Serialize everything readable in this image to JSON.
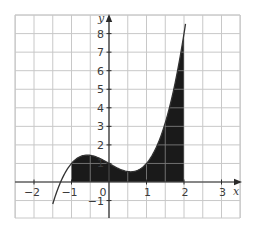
{
  "chart_data": {
    "type": "area",
    "title": "",
    "xlabel": "x",
    "ylabel": "y",
    "xlim": [
      -2.5,
      3.5
    ],
    "ylim": [
      -2,
      9
    ],
    "grid": true,
    "x_ticks": [
      -2,
      -1,
      0,
      1,
      2,
      3
    ],
    "x_tick_labels": [
      "−2",
      "−1",
      "0",
      "1",
      "2",
      "3"
    ],
    "y_ticks": [
      -1,
      1,
      2,
      3,
      4,
      5,
      6,
      7,
      8
    ],
    "y_tick_labels": [
      "−1",
      "1",
      "2",
      "3",
      "4",
      "5",
      "6",
      "7",
      "8"
    ],
    "curve": {
      "description": "cubic curve passing through (-1.5,-1.19), (-1,1), (-0.5,1.44), (0,1), (0.5,0.56), (1,1), (2,8)",
      "x": [
        -1.5,
        -1.25,
        -1,
        -0.75,
        -0.5,
        -0.25,
        0,
        0.25,
        0.5,
        0.75,
        1,
        1.25,
        1.5,
        1.75,
        2,
        2.05
      ],
      "y": [
        -1.19,
        0.29,
        1.0,
        1.33,
        1.44,
        1.29,
        1.0,
        0.71,
        0.56,
        0.67,
        1.0,
        1.82,
        3.19,
        4.76,
        8.0,
        8.43
      ]
    },
    "shaded_region": {
      "from_x": -1,
      "to_x": 2,
      "description": "area under the curve between x = -1 and x = 2, filled dark"
    },
    "colors": {
      "grid": "#c8c8c8",
      "axis": "#2a2a2a",
      "curve": "#333333",
      "fill": "#1a1a1a"
    }
  }
}
